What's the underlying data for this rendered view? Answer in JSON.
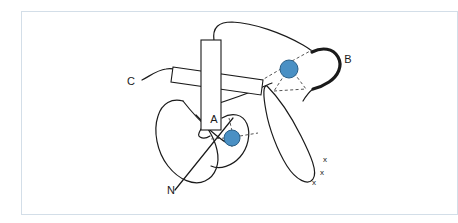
{
  "figure": {
    "kind": "protein-topology-schematic",
    "frame": {
      "border_color": "#d3dee8",
      "background_color": "#ffffff"
    },
    "colors": {
      "metal_site_fill": "#4a90c4",
      "metal_site_stroke": "#2a5f87",
      "backbone_stroke": "#1a1a1a",
      "helix_fill": "#ffffff",
      "helix_stroke": "#1a1a1a",
      "coordination_bond": "#555555",
      "label_color": "#1a1a1a"
    },
    "labels": {
      "terminus_c": "C",
      "terminus_n": "N",
      "helix_a": "A",
      "loop_b": "B",
      "x_mark_1": "x",
      "x_mark_2": "x",
      "x_mark_3": "x"
    },
    "elements": {
      "helix_vertical_name": "A",
      "helix_horizontal_name": "",
      "metal_site_upper_name": "",
      "metal_site_lower_name": "",
      "coordination_bonds_upper": 4,
      "coordination_bonds_lower": 3
    }
  }
}
